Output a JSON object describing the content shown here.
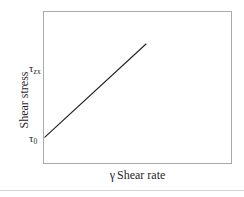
{
  "figure": {
    "title": "",
    "background_color": "#ffffff",
    "frame_color": "#a9a9a9",
    "line_color": "#262626"
  },
  "axes": {
    "y_axis_title": "Shear stress",
    "x_axis_title_symbol": "γ",
    "x_axis_title_text": "Shear rate",
    "y_ticks": [
      {
        "symbol": "τ",
        "subscript": "zx"
      },
      {
        "symbol": "τ",
        "subscript": "0"
      }
    ]
  },
  "chart_data": {
    "type": "line",
    "title": "",
    "xlabel": "γ Shear rate",
    "ylabel": "Shear stress",
    "xlim": [
      0,
      1
    ],
    "ylim": [
      0,
      1
    ],
    "grid": false,
    "legend": "none",
    "axis_tick_labels": {
      "y": [
        "τ_zx",
        "τ_0"
      ],
      "x": []
    },
    "series": [
      {
        "name": "Bingham plastic flow curve",
        "x": [
          0.01,
          0.545
        ],
        "y": [
          0.176,
          0.784
        ],
        "style": "solid",
        "color": "#262626",
        "width": 1.2
      }
    ],
    "annotations": [
      {
        "text": "τ_zx",
        "x": -0.07,
        "y": 0.63,
        "note": "shear stress tick label"
      },
      {
        "text": "τ_0",
        "x": -0.07,
        "y": 0.17,
        "note": "yield stress intercept label"
      }
    ]
  }
}
